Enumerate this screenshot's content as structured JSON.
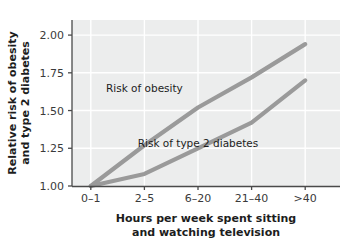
{
  "chart_data": {
    "type": "line",
    "title": "",
    "subtitle": "",
    "xlabel_line1": "Hours per week spent sitting",
    "xlabel_line2": "and watching television",
    "ylabel_line1": "Relative risk of obesity",
    "ylabel_line2": "and type 2 diabetes",
    "categories": [
      "0–1",
      "2–5",
      "6–20",
      "21–40",
      ">40"
    ],
    "ytick_labels": [
      "1.00",
      "1.25",
      "1.50",
      "1.75",
      "2.00"
    ],
    "ytick_values": [
      1.0,
      1.25,
      1.5,
      1.75,
      2.0
    ],
    "ylim": [
      1.0,
      2.1
    ],
    "xlim": [
      0,
      4
    ],
    "grid": true,
    "legend_position": "inline-annotations",
    "plot_background_color": "#eceded",
    "gridline_color": "#ffffff",
    "axis_color": "#4a4a4a",
    "series": [
      {
        "name": "Risk of obesity",
        "color": "#9a9a9a",
        "values": [
          1.0,
          1.27,
          1.52,
          1.72,
          1.94
        ],
        "annotation": "Risk of obesity"
      },
      {
        "name": "Risk of type 2 diabetes",
        "color": "#9a9a9a",
        "values": [
          1.0,
          1.08,
          1.25,
          1.42,
          1.7
        ],
        "annotation": "Risk of type 2 diabetes"
      }
    ],
    "annotations": [
      {
        "text": "Risk of obesity",
        "x": 1.0,
        "y": 1.62
      },
      {
        "text": "Risk of type 2 diabetes",
        "x": 2.0,
        "y": 1.26
      }
    ]
  }
}
